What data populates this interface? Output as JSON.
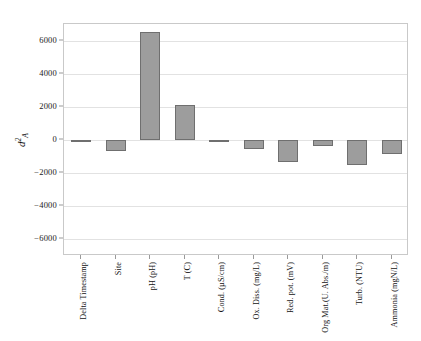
{
  "chart_data": {
    "type": "bar",
    "title": "",
    "subtitle": "",
    "xlabel": "",
    "ylabel": "d2A",
    "ylabel_parts": {
      "base": "d",
      "superscript": "2",
      "subscript": "A"
    },
    "categories": [
      "Delta Timestamp",
      "Site",
      "pH (pH)",
      "T (C)",
      "Cond. (µS/cm)",
      "Ox. Diss. (mg/L)",
      "Red. pot. (mV)",
      "Org Mat.(U. Abs./m)",
      "Turb. (NTU)",
      "Ammonia (mgN/L)"
    ],
    "values": [
      -100,
      -650,
      6500,
      2120,
      -90,
      -560,
      -1300,
      -380,
      -1520,
      -850
    ],
    "ylim": [
      -7000,
      7000
    ],
    "yticks": [
      6000,
      4000,
      2000,
      0,
      -2000,
      -4000,
      -6000
    ],
    "ytick_labels": [
      "6000",
      "4000",
      "2000",
      "0",
      "−2000",
      "−4000",
      "−6000"
    ],
    "grid": true,
    "legend": "none",
    "bar_color": "#9d9d9d",
    "bar_edge_color": "#6f6f6f",
    "grid_color": "#e2e2e2",
    "frame_color": "#c9c9c9"
  }
}
